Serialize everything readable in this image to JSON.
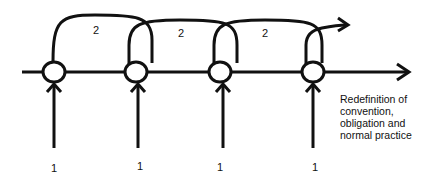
{
  "diagram": {
    "type": "cyclic-process",
    "nodes": [
      {
        "id": "n1",
        "x": 54
      },
      {
        "id": "n2",
        "x": 136
      },
      {
        "id": "n3",
        "x": 220
      },
      {
        "id": "n4",
        "x": 313
      }
    ],
    "input_labels": [
      "1",
      "1",
      "1",
      "1"
    ],
    "loop_labels": [
      "2",
      "2",
      "2"
    ],
    "output_note": [
      "Redefinition of",
      "convention,",
      "obligation and",
      "normal practice"
    ],
    "colors": {
      "stroke": "#111111",
      "background": "#ffffff"
    }
  }
}
